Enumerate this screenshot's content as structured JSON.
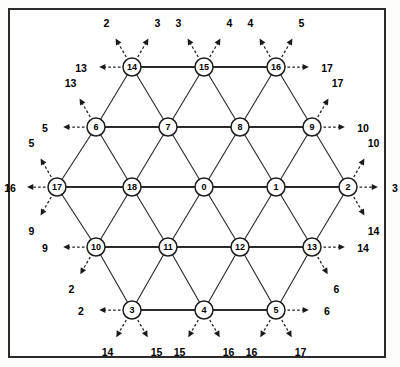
{
  "figure": {
    "node_count": 19,
    "colors": {
      "background": "#ffffff",
      "border": "#2a2a2a",
      "edge": "#2b2b2b",
      "node_fill": "#ffffff",
      "node_stroke": "#1d1d1d",
      "stub": "#1f1f1f",
      "text": "#000000"
    },
    "geometry": {
      "frame": {
        "x": 8,
        "y": 8,
        "width": 378,
        "height": 350
      },
      "node_radius": 9,
      "row_spacing": 60,
      "col_spacing": 72
    }
  },
  "nodes": [
    {
      "id": "n14",
      "label": "14",
      "x": 132,
      "y": 67,
      "row": 1
    },
    {
      "id": "n15",
      "label": "15",
      "x": 204,
      "y": 67,
      "row": 1
    },
    {
      "id": "n16",
      "label": "16",
      "x": 276,
      "y": 67,
      "row": 1
    },
    {
      "id": "n6",
      "label": "6",
      "x": 96,
      "y": 127,
      "row": 2
    },
    {
      "id": "n7",
      "label": "7",
      "x": 168,
      "y": 127,
      "row": 2
    },
    {
      "id": "n8",
      "label": "8",
      "x": 240,
      "y": 127,
      "row": 2
    },
    {
      "id": "n9",
      "label": "9",
      "x": 312,
      "y": 127,
      "row": 2
    },
    {
      "id": "n17",
      "label": "17",
      "x": 57,
      "y": 187,
      "row": 3
    },
    {
      "id": "n18",
      "label": "18",
      "x": 132,
      "y": 187,
      "row": 3
    },
    {
      "id": "n0",
      "label": "0",
      "x": 204,
      "y": 187,
      "row": 3
    },
    {
      "id": "n1",
      "label": "1",
      "x": 276,
      "y": 187,
      "row": 3
    },
    {
      "id": "n2",
      "label": "2",
      "x": 348,
      "y": 187,
      "row": 3
    },
    {
      "id": "n10",
      "label": "10",
      "x": 96,
      "y": 247,
      "row": 4
    },
    {
      "id": "n11",
      "label": "11",
      "x": 168,
      "y": 247,
      "row": 4
    },
    {
      "id": "n12",
      "label": "12",
      "x": 240,
      "y": 247,
      "row": 4
    },
    {
      "id": "n13",
      "label": "13",
      "x": 312,
      "y": 247,
      "row": 4
    },
    {
      "id": "n3",
      "label": "3",
      "x": 132,
      "y": 310,
      "row": 5
    },
    {
      "id": "n4",
      "label": "4",
      "x": 204,
      "y": 310,
      "row": 5
    },
    {
      "id": "n5",
      "label": "5",
      "x": 276,
      "y": 310,
      "row": 5
    }
  ],
  "edges": [
    {
      "from": "n14",
      "to": "n15",
      "kind": "horizontal"
    },
    {
      "from": "n15",
      "to": "n16",
      "kind": "horizontal"
    },
    {
      "from": "n6",
      "to": "n7",
      "kind": "horizontal"
    },
    {
      "from": "n7",
      "to": "n8",
      "kind": "horizontal"
    },
    {
      "from": "n8",
      "to": "n9",
      "kind": "horizontal"
    },
    {
      "from": "n17",
      "to": "n18",
      "kind": "horizontal"
    },
    {
      "from": "n18",
      "to": "n0",
      "kind": "horizontal"
    },
    {
      "from": "n0",
      "to": "n1",
      "kind": "horizontal"
    },
    {
      "from": "n1",
      "to": "n2",
      "kind": "horizontal"
    },
    {
      "from": "n10",
      "to": "n11",
      "kind": "horizontal"
    },
    {
      "from": "n11",
      "to": "n12",
      "kind": "horizontal"
    },
    {
      "from": "n12",
      "to": "n13",
      "kind": "horizontal"
    },
    {
      "from": "n3",
      "to": "n4",
      "kind": "horizontal"
    },
    {
      "from": "n4",
      "to": "n5",
      "kind": "horizontal"
    },
    {
      "from": "n14",
      "to": "n6",
      "kind": "diagonal"
    },
    {
      "from": "n14",
      "to": "n7",
      "kind": "diagonal"
    },
    {
      "from": "n15",
      "to": "n7",
      "kind": "diagonal"
    },
    {
      "from": "n15",
      "to": "n8",
      "kind": "diagonal"
    },
    {
      "from": "n16",
      "to": "n8",
      "kind": "diagonal"
    },
    {
      "from": "n16",
      "to": "n9",
      "kind": "diagonal"
    },
    {
      "from": "n6",
      "to": "n17",
      "kind": "diagonal"
    },
    {
      "from": "n6",
      "to": "n18",
      "kind": "diagonal"
    },
    {
      "from": "n7",
      "to": "n18",
      "kind": "diagonal"
    },
    {
      "from": "n7",
      "to": "n0",
      "kind": "diagonal"
    },
    {
      "from": "n8",
      "to": "n0",
      "kind": "diagonal"
    },
    {
      "from": "n8",
      "to": "n1",
      "kind": "diagonal"
    },
    {
      "from": "n9",
      "to": "n1",
      "kind": "diagonal"
    },
    {
      "from": "n9",
      "to": "n2",
      "kind": "diagonal"
    },
    {
      "from": "n17",
      "to": "n10",
      "kind": "diagonal"
    },
    {
      "from": "n18",
      "to": "n10",
      "kind": "diagonal"
    },
    {
      "from": "n18",
      "to": "n11",
      "kind": "diagonal"
    },
    {
      "from": "n0",
      "to": "n11",
      "kind": "diagonal"
    },
    {
      "from": "n0",
      "to": "n12",
      "kind": "diagonal"
    },
    {
      "from": "n1",
      "to": "n12",
      "kind": "diagonal"
    },
    {
      "from": "n1",
      "to": "n13",
      "kind": "diagonal"
    },
    {
      "from": "n2",
      "to": "n13",
      "kind": "diagonal"
    },
    {
      "from": "n10",
      "to": "n3",
      "kind": "diagonal"
    },
    {
      "from": "n11",
      "to": "n3",
      "kind": "diagonal"
    },
    {
      "from": "n11",
      "to": "n4",
      "kind": "diagonal"
    },
    {
      "from": "n12",
      "to": "n4",
      "kind": "diagonal"
    },
    {
      "from": "n12",
      "to": "n5",
      "kind": "diagonal"
    },
    {
      "from": "n13",
      "to": "n5",
      "kind": "diagonal"
    }
  ],
  "stubs": [
    {
      "node": "n14",
      "label": "2",
      "dir": "up-left",
      "len": 30
    },
    {
      "node": "n14",
      "label": "3",
      "dir": "up-right",
      "len": 30
    },
    {
      "node": "n14",
      "label": "13",
      "dir": "left",
      "len": 30
    },
    {
      "node": "n15",
      "label": "3",
      "dir": "up-left",
      "len": 30
    },
    {
      "node": "n15",
      "label": "4",
      "dir": "up-right",
      "len": 30
    },
    {
      "node": "n16",
      "label": "4",
      "dir": "up-left",
      "len": 30
    },
    {
      "node": "n16",
      "label": "5",
      "dir": "up-right",
      "len": 30
    },
    {
      "node": "n16",
      "label": "17",
      "dir": "right",
      "len": 30
    },
    {
      "node": "n6",
      "label": "13",
      "dir": "up-left",
      "len": 30
    },
    {
      "node": "n6",
      "label": "5",
      "dir": "left",
      "len": 30
    },
    {
      "node": "n9",
      "label": "17",
      "dir": "up-right",
      "len": 30
    },
    {
      "node": "n9",
      "label": "10",
      "dir": "right",
      "len": 30
    },
    {
      "node": "n17",
      "label": "5",
      "dir": "up-left",
      "len": 30
    },
    {
      "node": "n17",
      "label": "16",
      "dir": "left",
      "len": 26
    },
    {
      "node": "n17",
      "label": "9",
      "dir": "down-left",
      "len": 30
    },
    {
      "node": "n2",
      "label": "10",
      "dir": "up-right",
      "len": 30
    },
    {
      "node": "n2",
      "label": "3",
      "dir": "right",
      "len": 26
    },
    {
      "node": "n2",
      "label": "14",
      "dir": "down-right",
      "len": 30
    },
    {
      "node": "n10",
      "label": "9",
      "dir": "left",
      "len": 30
    },
    {
      "node": "n10",
      "label": "2",
      "dir": "down-left",
      "len": 28
    },
    {
      "node": "n13",
      "label": "14",
      "dir": "right",
      "len": 30
    },
    {
      "node": "n13",
      "label": "6",
      "dir": "down-right",
      "len": 28
    },
    {
      "node": "n3",
      "label": "2",
      "dir": "left",
      "len": 30
    },
    {
      "node": "n3",
      "label": "14",
      "dir": "down-left",
      "len": 28
    },
    {
      "node": "n3",
      "label": "15",
      "dir": "down-right",
      "len": 28
    },
    {
      "node": "n4",
      "label": "15",
      "dir": "down-left",
      "len": 28
    },
    {
      "node": "n4",
      "label": "16",
      "dir": "down-right",
      "len": 28
    },
    {
      "node": "n5",
      "label": "16",
      "dir": "down-left",
      "len": 28
    },
    {
      "node": "n5",
      "label": "17",
      "dir": "down-right",
      "len": 28
    },
    {
      "node": "n5",
      "label": "6",
      "dir": "right",
      "len": 30
    }
  ]
}
